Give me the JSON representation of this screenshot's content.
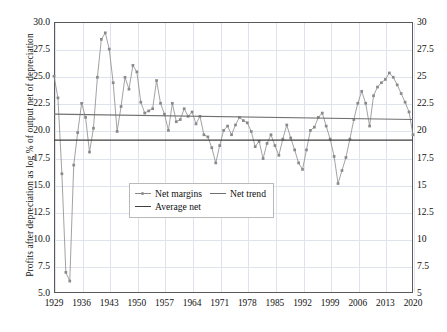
{
  "chart_data": {
    "type": "line",
    "title": "",
    "xlabel": "",
    "ylabel": "Profits after depreciation as log % of output net of depreciation",
    "xlim": [
      1929,
      2020
    ],
    "ylim": [
      5,
      30
    ],
    "grid": true,
    "legend_position": "center-left-inside",
    "x_ticks": [
      "1929",
      "1936",
      "1943",
      "1950",
      "1957",
      "1964",
      "1971",
      "1978",
      "1985",
      "1992",
      "1999",
      "2006",
      "2013",
      "2020"
    ],
    "y_ticks_left": [
      "30.0",
      "27.5",
      "25.0",
      "22.5",
      "20.0",
      "17.5",
      "15.0",
      "12.5",
      "10.0",
      "7.5",
      "5.0"
    ],
    "y_ticks_right": [
      "30",
      "27.5",
      "25",
      "22.5",
      "20",
      "17.5",
      "15",
      "12.5",
      "10",
      "7.5",
      "5"
    ],
    "y_tick_values": [
      30,
      27.5,
      25,
      22.5,
      20,
      17.5,
      15,
      12.5,
      10,
      7.5,
      5
    ],
    "x_tick_values": [
      1929,
      1936,
      1943,
      1950,
      1957,
      1964,
      1971,
      1978,
      1985,
      1992,
      1999,
      2006,
      2013,
      2020
    ],
    "colors": {
      "net_margins": "#8a8a8a",
      "net_trend": "#707070",
      "average_net": "#3f3f3f",
      "grid": "#dfe3ee",
      "frame": "#5a5a5a"
    },
    "series": [
      {
        "name": "Net margins",
        "marker": "square",
        "x": [
          1929,
          1930,
          1931,
          1932,
          1933,
          1934,
          1935,
          1936,
          1937,
          1938,
          1939,
          1940,
          1941,
          1942,
          1943,
          1944,
          1945,
          1946,
          1947,
          1948,
          1949,
          1950,
          1951,
          1952,
          1953,
          1954,
          1955,
          1956,
          1957,
          1958,
          1959,
          1960,
          1961,
          1962,
          1963,
          1964,
          1965,
          1966,
          1967,
          1968,
          1969,
          1970,
          1971,
          1972,
          1973,
          1974,
          1975,
          1976,
          1977,
          1978,
          1979,
          1980,
          1981,
          1982,
          1983,
          1984,
          1985,
          1986,
          1987,
          1988,
          1989,
          1990,
          1991,
          1992,
          1993,
          1994,
          1995,
          1996,
          1997,
          1998,
          1999,
          2000,
          2001,
          2002,
          2003,
          2004,
          2005,
          2006,
          2007,
          2008,
          2009,
          2010,
          2011,
          2012,
          2013,
          2014,
          2015,
          2016,
          2017,
          2018,
          2019,
          2020
        ],
        "values": [
          25.0,
          23.0,
          16.0,
          6.9,
          6.1,
          16.8,
          19.8,
          22.5,
          21.2,
          18.0,
          20.2,
          24.9,
          28.4,
          29.0,
          27.5,
          24.4,
          19.9,
          22.2,
          24.9,
          23.8,
          26.0,
          25.4,
          22.6,
          21.6,
          21.8,
          22.0,
          24.6,
          22.5,
          21.5,
          20.0,
          22.5,
          20.8,
          21.0,
          22.0,
          21.3,
          21.7,
          20.6,
          21.3,
          19.6,
          19.4,
          18.4,
          17.0,
          18.6,
          20.0,
          20.4,
          19.6,
          20.5,
          21.2,
          20.9,
          20.7,
          19.9,
          18.5,
          19.0,
          17.4,
          18.8,
          19.6,
          18.6,
          17.7,
          19.2,
          20.5,
          19.3,
          18.2,
          17.0,
          16.4,
          18.2,
          20.0,
          20.3,
          21.2,
          21.6,
          20.4,
          19.2,
          17.6,
          15.1,
          16.3,
          17.5,
          19.2,
          21.0,
          22.5,
          23.6,
          22.5,
          20.4,
          23.2,
          24.0,
          24.4,
          24.7,
          25.3,
          24.9,
          24.2,
          23.4,
          22.6,
          21.7,
          19.6
        ]
      },
      {
        "name": "Net trend",
        "marker": "none",
        "x": [
          1929,
          2020
        ],
        "values": [
          21.5,
          21.0
        ]
      },
      {
        "name": "Average net",
        "marker": "none",
        "x": [
          1929,
          2020
        ],
        "values": [
          19.1,
          19.1
        ]
      }
    ]
  },
  "legend": {
    "items": [
      {
        "label": "Net margins"
      },
      {
        "label": "Net trend"
      },
      {
        "label": "Average net"
      }
    ]
  }
}
